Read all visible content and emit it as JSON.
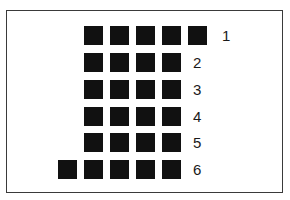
{
  "diagram": {
    "square_color": "#111111",
    "border_color": "#3a3a3a",
    "rows": [
      {
        "label": "1",
        "squares": 5,
        "start_col": 1
      },
      {
        "label": "2",
        "squares": 4,
        "start_col": 1
      },
      {
        "label": "3",
        "squares": 4,
        "start_col": 1
      },
      {
        "label": "4",
        "squares": 4,
        "start_col": 1
      },
      {
        "label": "5",
        "squares": 4,
        "start_col": 1
      },
      {
        "label": "6",
        "squares": 5,
        "start_col": 0
      }
    ]
  }
}
